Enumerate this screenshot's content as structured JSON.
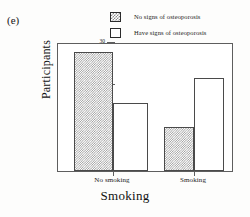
{
  "panel": {
    "label": "(e)"
  },
  "legend": {
    "position": "top-center",
    "items": [
      {
        "label": "No signs of osteoporosis",
        "swatch": "hatched-square-icon"
      },
      {
        "label": "Have signs of osteoporosis",
        "swatch": "white-square-icon"
      }
    ]
  },
  "axes": {
    "y_title": "Participants",
    "x_title": "Smoking",
    "y_ticks": [
      "0",
      "10",
      "20",
      "30"
    ],
    "x_categories": [
      "No smoking",
      "Smoking"
    ]
  },
  "chart_data": {
    "type": "bar",
    "title": "",
    "subtitle": "",
    "panel_label": "(e)",
    "categories": [
      "No smoking",
      "Smoking"
    ],
    "series": [
      {
        "name": "No signs of osteoporosis",
        "values": [
          28,
          10.5
        ],
        "fill": "hatched"
      },
      {
        "name": "Have signs of osteoporosis",
        "values": [
          16,
          22
        ],
        "fill": "white"
      }
    ],
    "xlabel": "Smoking",
    "ylabel": "Participants",
    "ylim": [
      0,
      30
    ],
    "yticks": [
      0,
      10,
      20,
      30
    ],
    "grid": false,
    "legend_position": "top-center"
  }
}
